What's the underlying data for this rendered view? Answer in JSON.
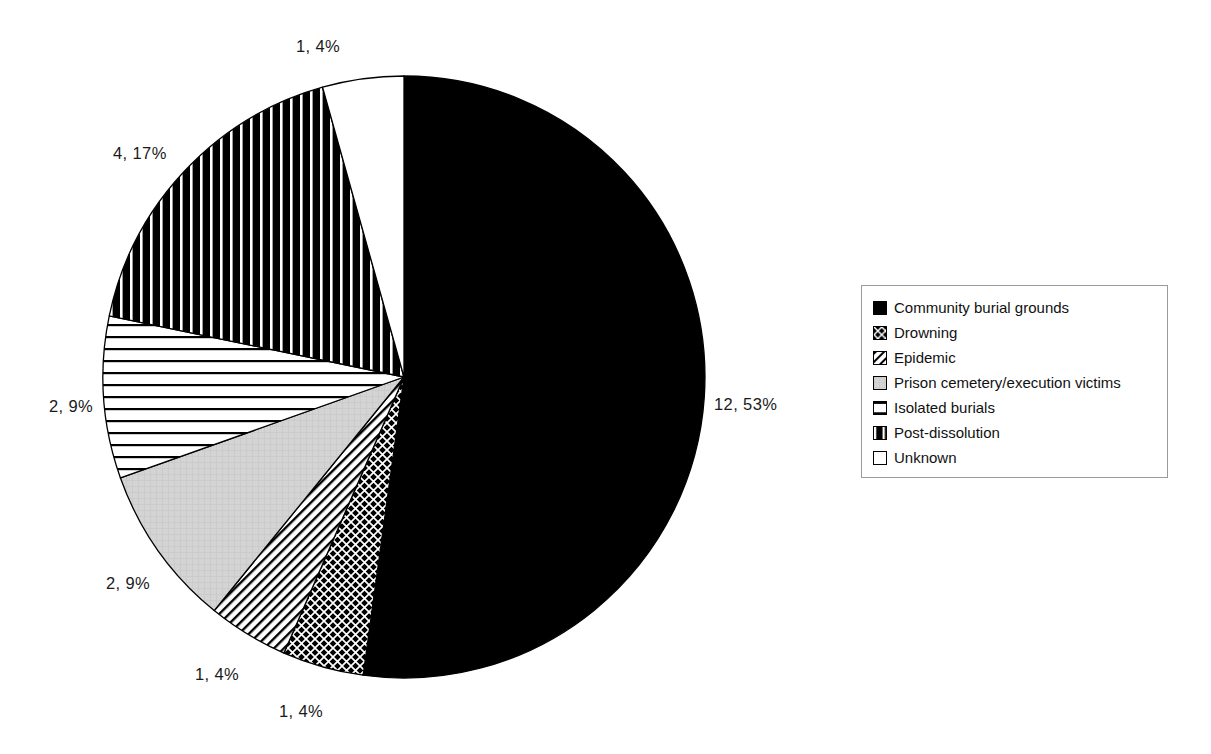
{
  "chart_data": {
    "type": "pie",
    "title": "",
    "subtitle": "",
    "xlabel": "",
    "ylabel": "",
    "legend_position": "right",
    "label_format": "count, percent",
    "total": 23,
    "categories": [
      "Community burial grounds",
      "Drowning",
      "Epidemic",
      "Prison cemetery/execution victims",
      "Isolated burials",
      "Post-dissolution",
      "Unknown"
    ],
    "values": [
      12,
      1,
      1,
      2,
      2,
      4,
      1
    ],
    "percents": [
      53,
      4,
      4,
      9,
      9,
      17,
      4
    ],
    "slices": [
      {
        "label": "Community burial grounds",
        "value": 12,
        "percent": 53,
        "data_label": "12, 53%",
        "pattern": "solid-black",
        "fill": "#000000",
        "start_angle_deg": 0,
        "end_angle_deg": 187.8
      },
      {
        "label": "Drowning",
        "value": 1,
        "percent": 4,
        "data_label": "1, 4%",
        "pattern": "dense-crosshatch",
        "fill": "#1a1a1a",
        "start_angle_deg": 187.8,
        "end_angle_deg": 203.5
      },
      {
        "label": "Epidemic",
        "value": 1,
        "percent": 4,
        "data_label": "1, 4%",
        "pattern": "diagonal-stripes",
        "fill": "#ffffff",
        "start_angle_deg": 203.5,
        "end_angle_deg": 219.1
      },
      {
        "label": "Prison cemetery/execution victims",
        "value": 2,
        "percent": 9,
        "data_label": "2, 9%",
        "pattern": "light-gray",
        "fill": "#d0d0d0",
        "start_angle_deg": 219.1,
        "end_angle_deg": 250.4
      },
      {
        "label": "Isolated burials",
        "value": 2,
        "percent": 9,
        "data_label": "2, 9%",
        "pattern": "horizontal-stripes",
        "fill": "#ffffff",
        "start_angle_deg": 250.4,
        "end_angle_deg": 281.7
      },
      {
        "label": "Post-dissolution",
        "value": 4,
        "percent": 17,
        "data_label": "4, 17%",
        "pattern": "vertical-stripes",
        "fill": "#000000",
        "start_angle_deg": 281.7,
        "end_angle_deg": 344.3
      },
      {
        "label": "Unknown",
        "value": 1,
        "percent": 4,
        "data_label": "1, 4%",
        "pattern": "white",
        "fill": "#ffffff",
        "start_angle_deg": 344.3,
        "end_angle_deg": 360
      }
    ]
  },
  "labels": {
    "community": "12, 53%",
    "drowning": "1, 4%",
    "epidemic": "1, 4%",
    "prison": "2, 9%",
    "isolated": "2, 9%",
    "postdissolution": "4, 17%",
    "unknown": "1, 4%"
  },
  "legend": {
    "items": [
      {
        "label": "Community burial grounds",
        "swatch": "solid-black-swatch"
      },
      {
        "label": "Drowning",
        "swatch": "dense-crosshatch-swatch"
      },
      {
        "label": "Epidemic",
        "swatch": "diagonal-stripes-swatch"
      },
      {
        "label": "Prison cemetery/execution victims",
        "swatch": "light-gray-swatch"
      },
      {
        "label": "Isolated burials",
        "swatch": "horizontal-stripes-swatch"
      },
      {
        "label": "Post-dissolution",
        "swatch": "vertical-stripes-swatch"
      },
      {
        "label": "Unknown",
        "swatch": "white-swatch"
      }
    ]
  },
  "colors": {
    "outline": "#000000",
    "gray_fill": "#d0d0d0",
    "legend_border": "#9a9a9a",
    "text": "#111111",
    "background": "#ffffff"
  }
}
